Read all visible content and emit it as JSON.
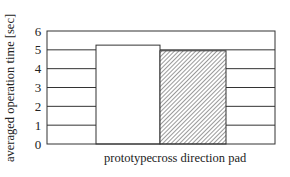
{
  "chart_data": {
    "type": "bar",
    "title": "",
    "xlabel": "",
    "ylabel": "averaged operation time [sec]",
    "categories": [
      "prototype",
      "cross direction pad"
    ],
    "values": [
      5.25,
      4.95
    ],
    "ylim": [
      0,
      6
    ],
    "yticks": [
      "0",
      "1",
      "2",
      "3",
      "4",
      "5",
      "6"
    ],
    "grid": true,
    "legend": null,
    "bar_styles": [
      {
        "fill": "#ffffff",
        "pattern": "none"
      },
      {
        "fill": "#ffffff",
        "pattern": "diagonal-hatch",
        "hatch_color": "#555555"
      }
    ],
    "colors": {
      "axis": "#333333",
      "grid": "#333333"
    }
  }
}
